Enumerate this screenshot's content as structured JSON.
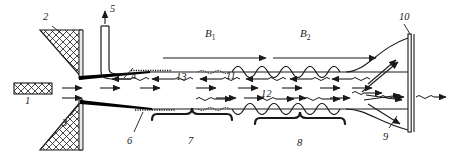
{
  "figure": {
    "type": "technical-line-diagram",
    "width": 450,
    "height": 156,
    "background": "#ffffff",
    "line_color": "#1a1a1a",
    "fill_color": "#000000"
  },
  "field_labels": [
    {
      "id": "B1",
      "base": "B",
      "sub": "1",
      "x": 208,
      "y": 33,
      "arrow": {
        "x1": 163,
        "y1": 58,
        "x2": 268,
        "y2": 58,
        "direction": "right"
      }
    },
    {
      "id": "B2",
      "base": "B",
      "sub": "2",
      "x": 303,
      "y": 33,
      "arrow": {
        "x1": 272,
        "y1": 58,
        "x2": 378,
        "y2": 58,
        "direction": "right"
      }
    }
  ],
  "callouts": [
    {
      "id": "1",
      "label": "1",
      "x": 27,
      "y": 96,
      "refers_to": "hatched-block-left"
    },
    {
      "id": "2",
      "label": "2",
      "x": 44,
      "y": 14,
      "refers_to": "upper-hatched-wedge"
    },
    {
      "id": "3",
      "label": "3",
      "x": 64,
      "y": 119,
      "refers_to": "lower-hatched-wedge"
    },
    {
      "id": "4",
      "label": "4",
      "x": 130,
      "y": 70,
      "refers_to": "upper-channel-wall"
    },
    {
      "id": "5",
      "label": "5",
      "x": 108,
      "y": 6,
      "refers_to": "gas-inlet-tube"
    },
    {
      "id": "6",
      "label": "6",
      "x": 129,
      "y": 136,
      "refers_to": "lower-channel-wall"
    },
    {
      "id": "7",
      "label": "7",
      "x": 190,
      "y": 138,
      "refers_to": "brace-region-7"
    },
    {
      "id": "8",
      "label": "8",
      "x": 300,
      "y": 140,
      "refers_to": "brace-region-8"
    },
    {
      "id": "9",
      "label": "9",
      "x": 385,
      "y": 134,
      "refers_to": "exit-plume-region"
    },
    {
      "id": "10",
      "label": "10",
      "x": 404,
      "y": 14,
      "refers_to": "collector-plate"
    },
    {
      "id": "11",
      "label": "11",
      "x": 228,
      "y": 70,
      "refers_to": "counter-stream-11"
    },
    {
      "id": "12",
      "label": "12",
      "x": 263,
      "y": 90,
      "refers_to": "forward-stream-12"
    },
    {
      "id": "13",
      "label": "13",
      "x": 178,
      "y": 71,
      "refers_to": "counter-stream-13"
    }
  ],
  "braces": [
    {
      "id": "brace-7",
      "x1": 152,
      "x2": 232,
      "y": 122,
      "label": "7"
    },
    {
      "id": "brace-8",
      "x1": 255,
      "x2": 345,
      "y": 125,
      "label": "8"
    }
  ],
  "flow_arrows": {
    "forward_count": 18,
    "reverse_count": 8,
    "forward_direction": "right",
    "reverse_direction": "left"
  }
}
